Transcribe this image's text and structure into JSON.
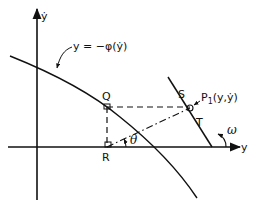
{
  "figure": {
    "axis_vertical_label": "ẏ",
    "axis_horizontal_label": "y",
    "curve_label": "y = −φ(ẏ)",
    "points": {
      "Q": "Q",
      "R": "R",
      "S": "S",
      "T": "T",
      "P1": "P",
      "P1_sub": "1",
      "P1_coords": "(y,ẏ)"
    },
    "angle_theta": "θ",
    "angle_omega": "ω"
  },
  "colors": {
    "ink": "#111111",
    "background": "#ffffff"
  }
}
